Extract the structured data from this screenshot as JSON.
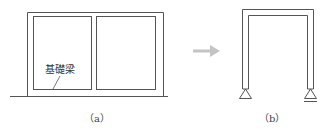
{
  "diagram": {
    "panel_a": {
      "caption": "（a）",
      "label": "基礎梁",
      "line_color": "#555555"
    },
    "arrow": {
      "direction": "right",
      "color": "#bdbdbd"
    },
    "panel_b": {
      "caption": "（b）",
      "supports": [
        "pin",
        "roller"
      ],
      "line_color": "#555555"
    }
  }
}
